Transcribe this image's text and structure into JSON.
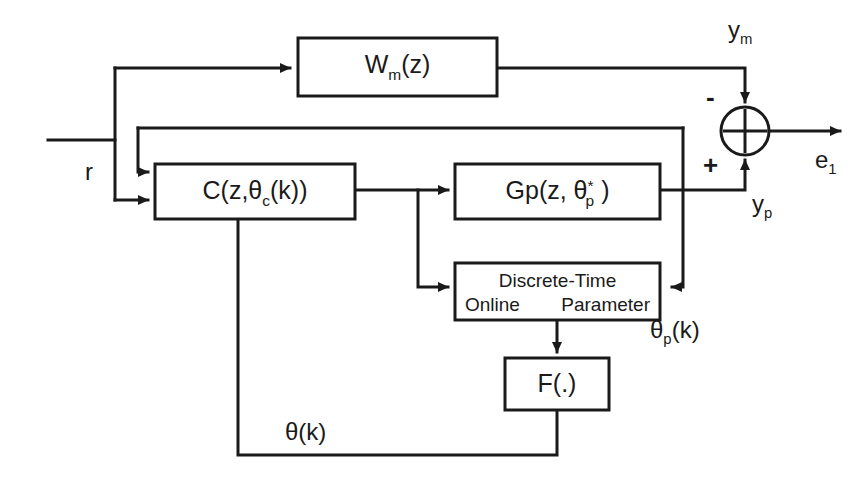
{
  "diagram": {
    "blocks": {
      "reference_model": {
        "name": "reference-model-block",
        "label_main": "W",
        "label_sub": "m",
        "label_tail": "(z)"
      },
      "controller": {
        "name": "controller-block",
        "label_main": "C(z,",
        "label_theta": "θ",
        "label_sub": "c",
        "label_tail": "(k))"
      },
      "plant": {
        "name": "plant-block",
        "label_main": "Gp(z, ",
        "label_theta": "θ",
        "label_sup": "*",
        "label_sub": "p",
        "label_tail": " )"
      },
      "estimator": {
        "name": "parameter-estimator-block",
        "line1": "Discrete-Time",
        "line2_left": "Online",
        "line2_right": "Parameter"
      },
      "mapping": {
        "name": "mapping-function-block",
        "label": "F(.)"
      }
    },
    "summing_junction": {
      "name": "summing-junction",
      "minus_sign": "-",
      "plus_sign": "+"
    },
    "signals": {
      "reference": "r",
      "model_output": {
        "base": "y",
        "sub": "m"
      },
      "plant_output": {
        "base": "y",
        "sub": "p"
      },
      "error": {
        "base": "e",
        "sub": "1"
      },
      "plant_parameters": {
        "base": "θ",
        "sub": "p",
        "tail": "(k)"
      },
      "controller_parameters": {
        "base": "θ",
        "tail": "(k)"
      }
    },
    "colors": {
      "line": "#1a1a1a",
      "background": "#ffffff",
      "block_fill": "#ffffff"
    }
  }
}
